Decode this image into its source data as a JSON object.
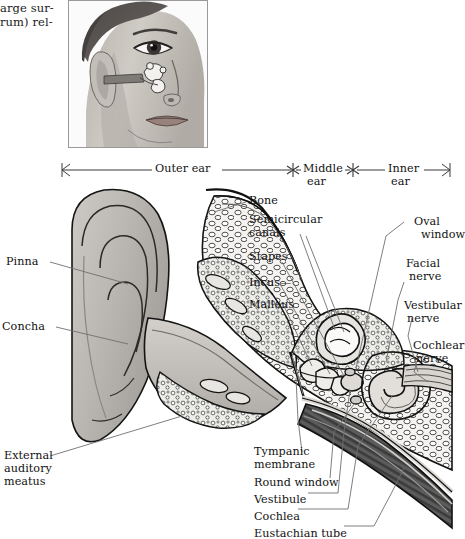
{
  "page": {
    "background": "#ffffff",
    "ink": "#121212",
    "figure_title": "Anatomy of the human ear"
  },
  "column_text": {
    "line1": "arge sur-",
    "line2": "rum) rel-"
  },
  "photo": {
    "alt_name": "head-profile-with-ear-inset",
    "description": "Drawing of a woman's face in three-quarter view with the middle-ear ossicles superimposed at ear level",
    "border_color": "#8a8a8a",
    "skin_light": "#cdc9c4",
    "skin_mid": "#b3aea8",
    "skin_shadow": "#8e8884",
    "hair": "#585452",
    "lip": "#9a7d78"
  },
  "scale_bar": {
    "segments": [
      {
        "label": "Outer ear",
        "label_line2": ""
      },
      {
        "label": "Middle",
        "label_line2": "ear"
      },
      {
        "label": "Inner",
        "label_line2": "ear"
      }
    ],
    "left_cap": "arrow-left",
    "right_cap": "arrow-right",
    "divider": "asterisk"
  },
  "labels": {
    "left": [
      {
        "name": "pinna",
        "text": "Pinna",
        "lines": [
          "Pinna"
        ]
      },
      {
        "name": "concha",
        "text": "Concha",
        "lines": [
          "Concha"
        ]
      },
      {
        "name": "external-auditory-meatus",
        "text": "External auditory meatus",
        "lines": [
          "External",
          "auditory",
          "meatus"
        ]
      }
    ],
    "mid_right": [
      {
        "name": "bone",
        "lines": [
          "Bone"
        ]
      },
      {
        "name": "semicircular-canals",
        "lines": [
          "Semicircular",
          "canals"
        ]
      },
      {
        "name": "stapes",
        "lines": [
          "Stapes"
        ]
      },
      {
        "name": "incus",
        "lines": [
          "Incus—"
        ]
      },
      {
        "name": "malleus",
        "lines": [
          "Malleus"
        ]
      }
    ],
    "far_right": [
      {
        "name": "oval-window",
        "lines": [
          "Oval",
          "window"
        ]
      },
      {
        "name": "facial-nerve",
        "lines": [
          "Facial",
          "nerve"
        ]
      },
      {
        "name": "vestibular-nerve",
        "lines": [
          "Vestibular",
          "nerve"
        ]
      },
      {
        "name": "cochlear-nerve",
        "lines": [
          "Cochlear",
          "nerve"
        ]
      }
    ],
    "bottom": [
      {
        "name": "tympanic-membrane",
        "lines": [
          "Tympanic",
          "membrane"
        ]
      },
      {
        "name": "round-window",
        "lines": [
          "Round window"
        ]
      },
      {
        "name": "vestibule",
        "lines": [
          "Vestibule"
        ]
      },
      {
        "name": "cochlea",
        "lines": [
          "Cochlea"
        ]
      },
      {
        "name": "eustachian-tube",
        "lines": [
          "Eustachian tube"
        ]
      }
    ]
  },
  "colors": {
    "outline": "#111111",
    "leader": "#6b6b6b",
    "cartilage_light": "#d9d6d1",
    "cartilage_mid": "#bbb7b1",
    "cartilage_dark": "#8d8984",
    "bone_fill": "#ffffff",
    "bone_edge": "#1a1a1a",
    "marrow": "#efeeec",
    "muscle_dark": "#4a4a4a",
    "muscle_mid": "#6f6f6f"
  }
}
